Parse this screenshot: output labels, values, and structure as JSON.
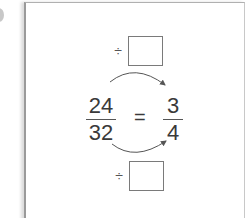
{
  "problem": {
    "top_operation": {
      "operator": "÷",
      "answer_box_value": ""
    },
    "bottom_operation": {
      "operator": "÷",
      "answer_box_value": ""
    },
    "left_fraction": {
      "numerator": "24",
      "denominator": "32"
    },
    "equals_sign": "=",
    "right_fraction": {
      "numerator": "3",
      "denominator": "4"
    }
  },
  "colors": {
    "text": "#3a3a3a",
    "frame_border": "#9a9a9a",
    "box_border": "#7a7a7a",
    "arrow": "#555555"
  }
}
